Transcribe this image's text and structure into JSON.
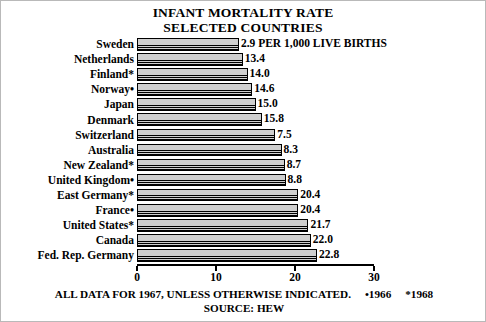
{
  "chart_data": {
    "type": "bar",
    "title": "INFANT MORTALITY RATE",
    "subtitle": "SELECTED COUNTRIES",
    "orientation": "horizontal",
    "xlabel": "",
    "ylabel": "",
    "xlim": [
      0,
      30
    ],
    "xticks": [
      0,
      10,
      20,
      30
    ],
    "xtick_labels": [
      "0",
      "10",
      "20",
      "30"
    ],
    "grid": false,
    "legend": null,
    "value_unit_note": "PER 1,000 LIVE BIRTHS",
    "categories": [
      "Sweden",
      "Netherlands",
      "Finland*",
      "Norway•",
      "Japan",
      "Denmark",
      "Switzerland",
      "Australia",
      "New Zealand*",
      "United Kingdom•",
      "East Germany*",
      "France•",
      "United States*",
      "Canada",
      "Fed. Rep. Germany"
    ],
    "values": [
      12.9,
      13.4,
      14.0,
      14.6,
      15.0,
      15.8,
      17.5,
      18.3,
      18.7,
      18.8,
      20.4,
      20.4,
      21.7,
      22.0,
      22.8
    ],
    "value_labels": [
      "2.9",
      "13.4",
      "14.0",
      "14.6",
      "15.0",
      "15.8",
      "7.5",
      "8.3",
      "8.7",
      "8.8",
      "20.4",
      "20.4",
      "21.7",
      "22.0",
      "22.8"
    ]
  },
  "footer": {
    "line1": "ALL DATA FOR 1967, UNLESS OTHERWISE INDICATED.",
    "note1": "•1966",
    "note2": "*1968",
    "line2": "SOURCE: HEW"
  }
}
